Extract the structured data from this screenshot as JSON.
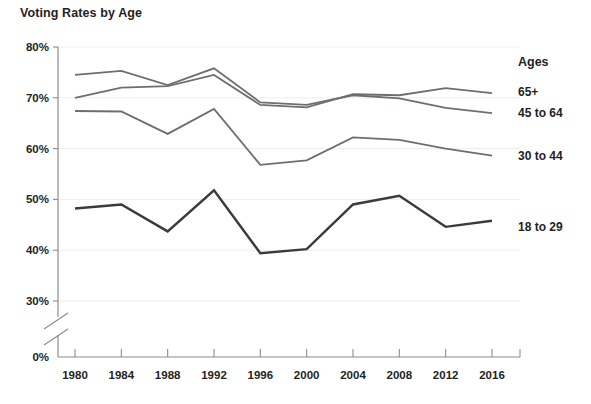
{
  "chart_data": {
    "type": "line",
    "title": "Voting Rates by Age",
    "xlabel": "",
    "ylabel": "",
    "x": [
      1980,
      1984,
      1988,
      1992,
      1996,
      2000,
      2004,
      2008,
      2012,
      2016
    ],
    "categories": [
      "1980",
      "1984",
      "1988",
      "1992",
      "1996",
      "2000",
      "2004",
      "2008",
      "2012",
      "2016"
    ],
    "ytick_labels": [
      "80%",
      "70%",
      "60%",
      "50%",
      "40%",
      "30%",
      "0%"
    ],
    "ytick_values": [
      80,
      70,
      60,
      50,
      40,
      30,
      0
    ],
    "ylim": [
      28,
      80
    ],
    "axis_break": true,
    "grid": true,
    "legend_position": "right",
    "legend_title": "Ages",
    "series": [
      {
        "name": "65+",
        "color": "#6d6e71",
        "values": [
          70.0,
          72.0,
          72.3,
          74.5,
          68.6,
          68.1,
          70.7,
          70.5,
          71.9,
          70.9
        ]
      },
      {
        "name": "45 to 64",
        "color": "#6d6e71",
        "values": [
          74.5,
          75.3,
          72.5,
          75.8,
          69.1,
          68.6,
          70.5,
          69.9,
          68.0,
          67.0
        ]
      },
      {
        "name": "30 to 44",
        "color": "#6d6e71",
        "values": [
          67.4,
          67.3,
          62.9,
          67.8,
          56.8,
          57.7,
          62.2,
          61.7,
          60.0,
          58.6
        ]
      },
      {
        "name": "18 to 29",
        "color": "#3b3b3d",
        "values": [
          48.2,
          49.0,
          43.7,
          51.8,
          39.4,
          40.2,
          49.0,
          50.7,
          44.6,
          45.8
        ]
      }
    ]
  },
  "chart": {
    "title": "Voting Rates by Age"
  },
  "legend": {
    "title": "Ages",
    "items": [
      {
        "label": "65+"
      },
      {
        "label": "45 to 64"
      },
      {
        "label": "30 to 44"
      },
      {
        "label": "18 to 29"
      }
    ]
  },
  "axes": {
    "y": {
      "ticks": [
        "80%",
        "70%",
        "60%",
        "50%",
        "40%",
        "30%",
        "0%"
      ]
    },
    "x": {
      "ticks": [
        "1980",
        "1984",
        "1988",
        "1992",
        "1996",
        "2000",
        "2004",
        "2008",
        "2012",
        "2016"
      ]
    }
  },
  "colors": {
    "text": "#231f20",
    "axis": "#8c8c8c",
    "grid": "#ededed",
    "series_light": "#6d6e71",
    "series_dark": "#3b3b3d",
    "background": "#ffffff"
  }
}
